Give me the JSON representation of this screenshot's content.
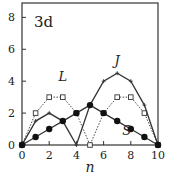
{
  "chart_data": {
    "type": "line",
    "title": "3d",
    "xlabel": "n",
    "ylabel": "",
    "xlim": [
      0,
      10
    ],
    "ylim": [
      0,
      8.9
    ],
    "xticks": [
      0,
      2,
      4,
      6,
      8,
      10
    ],
    "yticks": [
      0,
      2,
      4,
      6,
      8
    ],
    "grid": false,
    "legend": "inline labels",
    "x": [
      0,
      1,
      2,
      3,
      4,
      5,
      6,
      7,
      8,
      9,
      10
    ],
    "series": [
      {
        "name": "L",
        "style": "dotted",
        "marker": "open-square",
        "values": [
          0,
          2,
          3,
          3,
          2,
          0,
          2,
          3,
          3,
          2,
          0
        ],
        "label_pos": [
          3,
          4
        ]
      },
      {
        "name": "J",
        "style": "solid",
        "marker": "plus",
        "values": [
          0,
          1.5,
          2,
          1.5,
          0,
          2.5,
          4,
          4.5,
          4,
          2.5,
          0
        ],
        "label_pos": [
          7,
          5
        ]
      },
      {
        "name": "S",
        "style": "solid",
        "marker": "filled-circle",
        "values": [
          0,
          0.5,
          1,
          1.5,
          2,
          2.5,
          2,
          1.5,
          1,
          0.5,
          0
        ],
        "label_pos": [
          7.7,
          0.65
        ]
      }
    ],
    "colors": {
      "line": "#333333",
      "frame": "#333333",
      "background": "#ffffff"
    }
  }
}
